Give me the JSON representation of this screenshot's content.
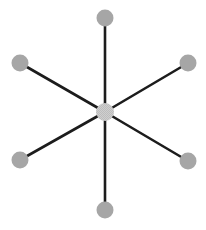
{
  "diagram": {
    "type": "star-graph",
    "width": 206,
    "height": 230,
    "colors": {
      "background": "#ffffff",
      "edge": "#1c1c1c",
      "node_fill": "#a6a6a6",
      "center_fill": "#c9c9c9"
    },
    "edge_width": 2.6,
    "center": {
      "id": "hub",
      "x": 105,
      "y": 112,
      "r": 9
    },
    "nodes": [
      {
        "id": "top",
        "x": 105,
        "y": 18,
        "r": 8.5
      },
      {
        "id": "upper-right",
        "x": 188,
        "y": 63,
        "r": 8.5
      },
      {
        "id": "lower-right",
        "x": 188,
        "y": 161,
        "r": 8.5
      },
      {
        "id": "bottom",
        "x": 105,
        "y": 210,
        "r": 8.5
      },
      {
        "id": "lower-left",
        "x": 20,
        "y": 160,
        "r": 8.5
      },
      {
        "id": "upper-left",
        "x": 20,
        "y": 63,
        "r": 8.5
      }
    ]
  }
}
